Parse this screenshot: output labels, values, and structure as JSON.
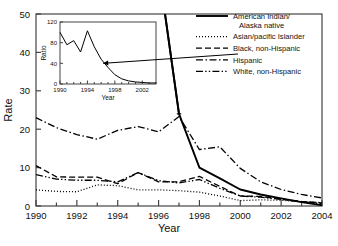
{
  "chart_data": {
    "type": "line",
    "title": "",
    "xlabel": "Year",
    "ylabel": "Rate",
    "xlim": [
      1990,
      2004
    ],
    "ylim": [
      0,
      50
    ],
    "xticks": [
      1990,
      1992,
      1994,
      1996,
      1998,
      2000,
      2002,
      2004
    ],
    "yticks": [
      0,
      10,
      20,
      30,
      40,
      50
    ],
    "xtick_labels": [
      "1990",
      "1992",
      "1994",
      "1996",
      "1998",
      "2000",
      "2002",
      "2004"
    ],
    "ytick_labels": [
      "0",
      "10",
      "20",
      "30",
      "40",
      "50"
    ],
    "grid": false,
    "legend_position": "top-right",
    "x": [
      1990,
      1991,
      1992,
      1993,
      1994,
      1995,
      1996,
      1997,
      1998,
      1999,
      2000,
      2001,
      2002,
      2003,
      2004
    ],
    "series": [
      {
        "name": "American Indian/Alaska native",
        "style": "solid",
        "note": "values before 1997 exceed the plotted y-axis maximum of 50",
        "values": [
          null,
          null,
          null,
          null,
          null,
          null,
          62,
          24,
          10,
          7.2,
          4.3,
          3.0,
          2.0,
          1.0,
          0.2
        ]
      },
      {
        "name": "Asian/pacific Islander",
        "style": "dotted",
        "values": [
          4.2,
          3.8,
          3.7,
          5.5,
          5.3,
          4.2,
          4.2,
          4.0,
          3.6,
          2.6,
          1.4,
          1.6,
          1.5,
          1.1,
          0.9
        ]
      },
      {
        "name": "Black, non-Hispanic",
        "style": "dashed",
        "values": [
          10.5,
          7.6,
          7.5,
          7.5,
          5.8,
          8.7,
          6.3,
          6.3,
          7.7,
          5.1,
          2.6,
          2.5,
          1.8,
          1.2,
          0.8
        ]
      },
      {
        "name": "Hispanic",
        "style": "dashdot",
        "values": [
          23.0,
          20.4,
          18.6,
          17.4,
          19.7,
          20.7,
          19.3,
          23.3,
          14.7,
          15.4,
          9.8,
          6.3,
          4.3,
          3.0,
          2.1
        ]
      },
      {
        "name": "White, non-Hispanic",
        "style": "dashdotdot",
        "values": [
          8.2,
          7.0,
          6.7,
          6.7,
          6.3,
          8.7,
          6.6,
          6.0,
          6.9,
          4.6,
          2.6,
          2.3,
          1.7,
          1.1,
          0.6
        ]
      }
    ],
    "inset": {
      "type": "line",
      "xlabel": "Year",
      "ylabel": "Ratio",
      "xlim": [
        1990,
        2004
      ],
      "ylim": [
        0,
        120
      ],
      "xticks": [
        1990,
        1994,
        1998,
        2002
      ],
      "yticks": [
        0,
        40,
        80,
        120
      ],
      "xtick_labels": [
        "1990",
        "1994",
        "1998",
        "2002"
      ],
      "ytick_labels": [
        "0",
        "40",
        "80",
        "120"
      ],
      "x": [
        1990,
        1991,
        1992,
        1993,
        1994,
        1995,
        1996,
        1997,
        1998,
        1999,
        2000,
        2001,
        2002,
        2003,
        2004
      ],
      "values": [
        100,
        76,
        84,
        62,
        103,
        72,
        48,
        32,
        18,
        10,
        6,
        4,
        3,
        2,
        2
      ],
      "annotation": "arrow from main plot to inset curve"
    }
  },
  "legend": {
    "entries": [
      {
        "label_line1": "American Indian/",
        "label_line2": "Alaska native",
        "style": "solid"
      },
      {
        "label_line1": "Asian/pacific Islander",
        "label_line2": "",
        "style": "dotted"
      },
      {
        "label_line1": "Black, non-Hispanic",
        "label_line2": "",
        "style": "dashed"
      },
      {
        "label_line1": "Hispanic",
        "label_line2": "",
        "style": "dashdot"
      },
      {
        "label_line1": "White, non-Hispanic",
        "label_line2": "",
        "style": "dashdotdot"
      }
    ]
  },
  "colors": {
    "line": "#000000",
    "axis": "#444444",
    "background": "#ffffff"
  }
}
